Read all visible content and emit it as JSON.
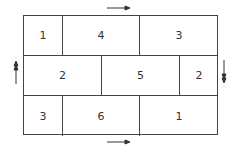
{
  "diagram": {
    "rows": [
      {
        "cells": [
          {
            "label": "1",
            "left": 0,
            "width": 39
          },
          {
            "label": "4",
            "left": 39,
            "width": 77
          },
          {
            "label": "3",
            "left": 116,
            "width": 78
          }
        ]
      },
      {
        "cells": [
          {
            "label": "2",
            "left": 0,
            "width": 78
          },
          {
            "label": "5",
            "left": 78,
            "width": 78
          },
          {
            "label": "2",
            "left": 156,
            "width": 38
          }
        ]
      },
      {
        "cells": [
          {
            "label": "3",
            "left": 0,
            "width": 39
          },
          {
            "label": "6",
            "left": 39,
            "width": 77
          },
          {
            "label": "1",
            "left": 116,
            "width": 78
          }
        ]
      }
    ],
    "arrows": [
      {
        "position": "top",
        "direction": "right"
      },
      {
        "position": "bottom",
        "direction": "right"
      },
      {
        "position": "left",
        "direction": "up"
      },
      {
        "position": "right",
        "direction": "down"
      }
    ],
    "colors": {
      "line": "#444444",
      "text": "#333333",
      "background": "#ffffff"
    }
  }
}
